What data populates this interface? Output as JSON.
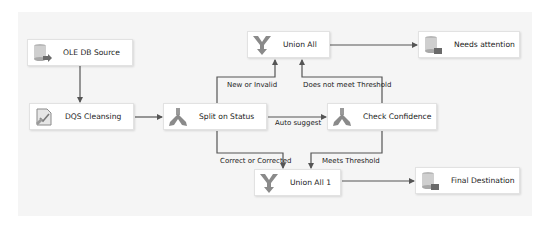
{
  "diagram": {
    "type": "ssis-data-flow",
    "nodes": [
      {
        "id": "ole_db_source",
        "label": "OLE DB Source",
        "icon": "database-source-icon"
      },
      {
        "id": "dqs_cleansing",
        "label": "DQS Cleansing",
        "icon": "dqs-cleansing-icon"
      },
      {
        "id": "split_on_status",
        "label": "Split on Status",
        "icon": "conditional-split-icon"
      },
      {
        "id": "check_confidence",
        "label": "Check Confidence",
        "icon": "conditional-split-icon"
      },
      {
        "id": "union_all",
        "label": "Union All",
        "icon": "union-all-icon"
      },
      {
        "id": "needs_attention",
        "label": "Needs attention",
        "icon": "database-destination-icon"
      },
      {
        "id": "union_all_1",
        "label": "Union All 1",
        "icon": "union-all-icon"
      },
      {
        "id": "final_destination",
        "label": "Final Destination",
        "icon": "database-destination-icon"
      }
    ],
    "edges": [
      {
        "from": "ole_db_source",
        "to": "dqs_cleansing",
        "label": ""
      },
      {
        "from": "dqs_cleansing",
        "to": "split_on_status",
        "label": ""
      },
      {
        "from": "split_on_status",
        "to": "union_all",
        "label": "New or Invalid"
      },
      {
        "from": "split_on_status",
        "to": "check_confidence",
        "label": "Auto suggest"
      },
      {
        "from": "split_on_status",
        "to": "union_all_1",
        "label": "Correct or Corrected"
      },
      {
        "from": "check_confidence",
        "to": "union_all",
        "label": "Does not meet Threshold"
      },
      {
        "from": "check_confidence",
        "to": "union_all_1",
        "label": "Meets Threshold"
      },
      {
        "from": "union_all",
        "to": "needs_attention",
        "label": ""
      },
      {
        "from": "union_all_1",
        "to": "final_destination",
        "label": ""
      }
    ]
  },
  "colors": {
    "canvas": "#f5f5f5",
    "wire": "#555555",
    "icon_gray": "#8a8a8a"
  }
}
